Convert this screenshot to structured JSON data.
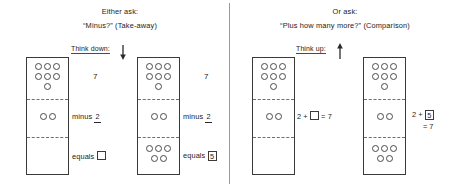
{
  "diagram": {
    "title_left_line1": "Either ask:",
    "title_left_line2": "“Minus?” (Take-away)",
    "title_right_line1": "Or ask:",
    "title_right_line2": "“Plus how many more?” (Comparison)",
    "think_down_label": "Think down:",
    "think_up_label": "Think up:",
    "down_arrow_icon": "arrow-down-icon",
    "up_arrow_icon": "arrow-up-icon",
    "divider_color": "#9a9a9a",
    "dot_border_color": "#4a4a4a",
    "box_border_color": "#3a3a3a",
    "dashed_color": "#6f6f6f"
  },
  "panels": [
    {
      "id": "takeaway-unsolved",
      "box": {
        "top_section_dots": [
          3,
          3,
          1
        ],
        "mid_section_dots": [
          2
        ],
        "bottom_section_dots": []
      },
      "annotations": {
        "total": "7",
        "minus_label": "minus",
        "minus_value": "2",
        "equals_label": "equals",
        "equals_value": "",
        "equals_is_blank": true
      }
    },
    {
      "id": "takeaway-solved",
      "box": {
        "top_section_dots": [
          3,
          3,
          1
        ],
        "mid_section_dots": [
          2
        ],
        "bottom_section_dots": [
          3,
          2
        ]
      },
      "annotations": {
        "total": "7",
        "minus_label": "minus",
        "minus_value": "2",
        "equals_label": "equals",
        "equals_value": "5",
        "equals_is_blank": false
      }
    },
    {
      "id": "comparison-unsolved",
      "box": {
        "top_section_dots": [
          3,
          3,
          1
        ],
        "mid_section_dots": [
          2
        ],
        "bottom_section_dots": []
      },
      "equation": {
        "lead": "2 +",
        "boxed_value": "",
        "is_blank": true,
        "tail": "= 7",
        "tail_on_new_line": false
      }
    },
    {
      "id": "comparison-solved",
      "box": {
        "top_section_dots": [
          3,
          3,
          1
        ],
        "mid_section_dots": [
          2
        ],
        "bottom_section_dots": [
          3,
          2
        ]
      },
      "equation": {
        "lead": "2 +",
        "boxed_value": "5",
        "is_blank": false,
        "tail": "= 7",
        "tail_on_new_line": true
      }
    }
  ]
}
